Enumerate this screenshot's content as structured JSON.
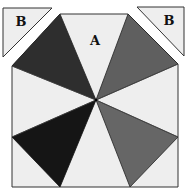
{
  "diagram": {
    "labels": {
      "center_piece": "A",
      "corner_left": "B",
      "corner_right": "B"
    },
    "colors": {
      "light": "#eeeeee",
      "dark": "#2e2e2e",
      "black": "#151515",
      "mid_gray": "#666666",
      "outline": "#333333"
    }
  }
}
